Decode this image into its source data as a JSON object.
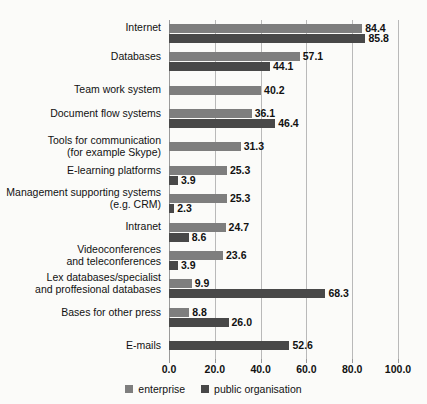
{
  "chart_data": {
    "type": "bar",
    "orientation": "horizontal",
    "title": "",
    "xlabel": "",
    "ylabel": "",
    "xlim": [
      0.0,
      100.0
    ],
    "xticks": [
      "0.0",
      "20.0",
      "40.0",
      "60.0",
      "80.0",
      "100.0"
    ],
    "xtick_values": [
      0,
      20,
      40,
      60,
      80,
      100
    ],
    "grid": "vertical",
    "legend_position": "bottom-center",
    "categories": [
      "Internet",
      "Databases",
      "Team work system",
      "Document flow systems",
      "Tools for communication\n(for example Skype)",
      "E-learning platforms",
      "Management supporting systems\n(e.g. CRM)",
      "Intranet",
      "Videoconferences\nand teleconferences",
      "Lex databases/specialist\nand proffesional databases",
      "Bases for other press",
      "E-mails"
    ],
    "series": [
      {
        "name": "enterprise",
        "color": "#7e7e7e",
        "values": [
          84.4,
          57.1,
          40.2,
          36.1,
          31.3,
          25.3,
          25.3,
          24.7,
          23.6,
          9.9,
          8.8,
          null
        ],
        "labels": [
          "84.4",
          "57.1",
          "40.2",
          "36.1",
          "31.3",
          "25.3",
          "25.3",
          "24.7",
          "23.6",
          "9.9",
          "8.8",
          ""
        ]
      },
      {
        "name": "public organisation",
        "color": "#484848",
        "values": [
          85.8,
          44.1,
          null,
          46.4,
          null,
          3.9,
          2.3,
          8.6,
          3.9,
          68.3,
          26.0,
          52.6
        ],
        "labels": [
          "85.8",
          "44.1",
          "",
          "46.4",
          "",
          "3.9",
          "2.3",
          "8.6",
          "3.9",
          "68.3",
          "26.0",
          "52.6"
        ]
      }
    ]
  },
  "legend": {
    "items": [
      {
        "label": "enterprise",
        "color": "#7e7e7e"
      },
      {
        "label": "public organisation",
        "color": "#484848"
      }
    ]
  },
  "top_bleed_text": ""
}
